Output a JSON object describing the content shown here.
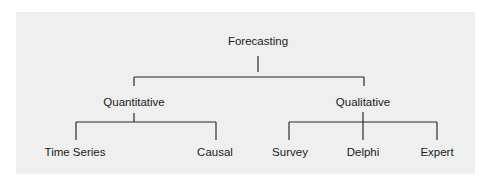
{
  "diagram": {
    "type": "tree",
    "colors": {
      "background": "#efefef",
      "line": "#2a2a2a",
      "text": "#1a1a1a"
    },
    "root": {
      "label": "Forecasting"
    },
    "branches": [
      {
        "label": "Quantitative",
        "children": [
          {
            "label": "Time Series"
          },
          {
            "label": "Causal"
          }
        ]
      },
      {
        "label": "Qualitative",
        "children": [
          {
            "label": "Survey"
          },
          {
            "label": "Delphi"
          },
          {
            "label": "Expert"
          }
        ]
      }
    ]
  }
}
